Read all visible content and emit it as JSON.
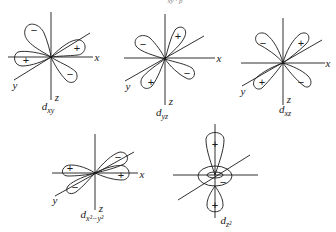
{
  "figure": {
    "header_fragment": "xy  ·  p",
    "orbitals": [
      {
        "id": "dxy",
        "caption_main": "d",
        "caption_sub": "xy",
        "axes": {
          "x": "x",
          "y": "y",
          "z": "z"
        },
        "lobes": [
          {
            "position": "upper-left",
            "sign": "−"
          },
          {
            "position": "upper-right",
            "sign": "+"
          },
          {
            "position": "left",
            "sign": "+"
          },
          {
            "position": "lower-right",
            "sign": "−"
          }
        ]
      },
      {
        "id": "dyz",
        "caption_main": "d",
        "caption_sub": "yz",
        "axes": {
          "x": "x",
          "y": "y",
          "z": "z"
        },
        "lobes": [
          {
            "position": "upper-left",
            "sign": "−"
          },
          {
            "position": "upper-right",
            "sign": "+"
          },
          {
            "position": "lower-left",
            "sign": "+"
          },
          {
            "position": "lower-right",
            "sign": "−"
          }
        ]
      },
      {
        "id": "dxz",
        "caption_main": "d",
        "caption_sub": "xz",
        "axes": {
          "x": "x",
          "y": "y",
          "z": "z"
        },
        "lobes": [
          {
            "position": "upper-left",
            "sign": "−"
          },
          {
            "position": "upper-right",
            "sign": "+"
          },
          {
            "position": "lower-left",
            "sign": "+"
          },
          {
            "position": "lower-right",
            "sign": "−"
          }
        ]
      },
      {
        "id": "dx2y2",
        "caption_main": "d",
        "caption_sub": "x²−y²",
        "axes": {
          "x": "x",
          "y": "y",
          "z": "z"
        },
        "lobes": [
          {
            "position": "left",
            "sign": "+"
          },
          {
            "position": "upper-right",
            "sign": "−"
          },
          {
            "position": "lower-left",
            "sign": "−"
          },
          {
            "position": "right",
            "sign": "+"
          }
        ]
      },
      {
        "id": "dz2",
        "caption_main": "d",
        "caption_sub": "z²",
        "lobes": [
          {
            "position": "top",
            "sign": "+"
          },
          {
            "position": "torus",
            "sign": "−"
          },
          {
            "position": "bottom",
            "sign": "+"
          }
        ]
      }
    ]
  }
}
